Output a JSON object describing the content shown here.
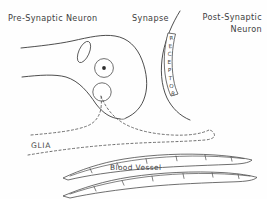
{
  "diagram": {
    "background_color": "#fefefe",
    "ink_color": "#3a3a3a",
    "labels": {
      "pre_synaptic": "Pre-Synaptic  Neuron",
      "synapse": "Synapse",
      "post_synaptic_line1": "Post-Synaptic",
      "post_synaptic_line2": "Neuron",
      "glia": "GLIA",
      "blood_vessel": "Blood  Vessel"
    },
    "receptor": {
      "word": "RECEPTOR",
      "letters": [
        "R",
        "E",
        "C",
        "E",
        "P",
        "T",
        "O",
        "R"
      ],
      "orientation": "vertical-stacked"
    },
    "structures": [
      {
        "name": "pre-synaptic-axon-terminal",
        "kind": "outline"
      },
      {
        "name": "nucleus",
        "kind": "organelle-circle"
      },
      {
        "name": "nucleolus",
        "kind": "organelle-dot"
      },
      {
        "name": "mitochondrion",
        "kind": "organelle-ellipse"
      },
      {
        "name": "vacuole",
        "kind": "organelle-circle"
      },
      {
        "name": "synaptic-cleft",
        "kind": "gap"
      },
      {
        "name": "post-synaptic-membrane",
        "kind": "outline"
      },
      {
        "name": "glia-cell-outline",
        "kind": "dashed-outline"
      },
      {
        "name": "blood-vessel-upper",
        "kind": "tube"
      },
      {
        "name": "blood-vessel-lower",
        "kind": "tube"
      }
    ]
  }
}
